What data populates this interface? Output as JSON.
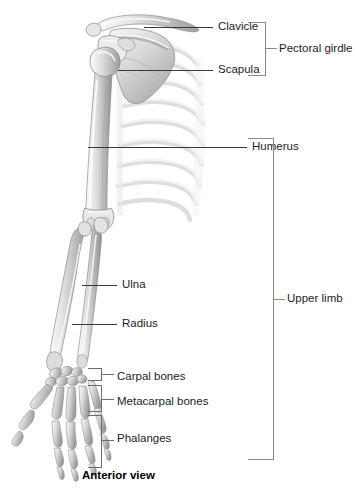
{
  "figure": {
    "caption": "Anterior view",
    "background_color": "#ffffff",
    "leader_line_color": "#3a3a3a",
    "bracket_color": "#6e6e6e",
    "text_color": "#1d1d1d"
  },
  "labels": {
    "clavicle": "Clavicle",
    "scapula": "Scapula",
    "humerus": "Humerus",
    "ulna": "Ulna",
    "radius": "Radius",
    "carpal_bones": "Carpal bones",
    "metacarpal_bones": "Metacarpal bones",
    "phalanges": "Phalanges"
  },
  "group_labels": {
    "pectoral_girdle": "Pectoral girdle",
    "upper_limb": "Upper limb"
  },
  "anatomy_parts": [
    "clavicle",
    "scapula",
    "ribs",
    "humerus",
    "ulna",
    "radius",
    "carpal-bones",
    "metacarpal-bones",
    "phalanges"
  ]
}
